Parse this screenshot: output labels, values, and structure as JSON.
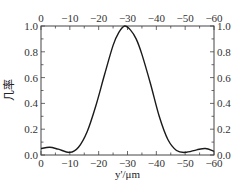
{
  "chart_data": {
    "type": "line",
    "title": "",
    "xlabel": "y'/μm",
    "ylabel": "几率",
    "xlim": [
      0,
      -60
    ],
    "ylim": [
      0,
      1.0
    ],
    "x_ticks": [
      0,
      -10,
      -20,
      -30,
      -40,
      -50,
      -60
    ],
    "x_tick_labels": [
      "0",
      "−10",
      "−20",
      "−30",
      "−40",
      "−50",
      "−60"
    ],
    "y_ticks": [
      0.0,
      0.2,
      0.4,
      0.6,
      0.8,
      1.0
    ],
    "y_tick_labels": [
      "0.0",
      "0.2",
      "0.4",
      "0.6",
      "0.8",
      "1.0"
    ],
    "top_axis_mirrored": true,
    "right_axis_mirrored": true,
    "grid": false,
    "legend": null,
    "series": [
      {
        "name": "probability",
        "color": "#1a1a1a",
        "x": [
          0,
          -3,
          -6,
          -10,
          -13,
          -16,
          -19,
          -22,
          -25,
          -27,
          -29,
          -31,
          -33,
          -35,
          -38,
          -41,
          -44,
          -47,
          -50,
          -54,
          -57,
          -60
        ],
        "y": [
          0.05,
          0.06,
          0.045,
          0.02,
          0.06,
          0.18,
          0.38,
          0.62,
          0.85,
          0.95,
          1.0,
          0.97,
          0.9,
          0.78,
          0.55,
          0.3,
          0.12,
          0.035,
          0.02,
          0.04,
          0.05,
          0.03
        ]
      }
    ]
  }
}
